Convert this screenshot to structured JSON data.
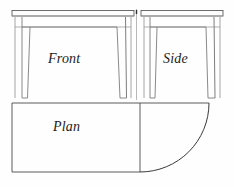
{
  "drawing": {
    "title": "Half-round (demilune) table — orthographic projection",
    "background_color": "#fefefe",
    "line_color": "#3a3a3a",
    "line_color_light": "#8a8a8a",
    "label_color": "#1c1c1c",
    "views": [
      {
        "id": "front",
        "label": "Front",
        "label_x": 48,
        "label_y": 52,
        "font_size": 14,
        "font_style": "italic"
      },
      {
        "id": "side",
        "label": "Side",
        "label_x": 163,
        "label_y": 52,
        "font_size": 14,
        "font_style": "italic"
      },
      {
        "id": "plan",
        "label": "Plan",
        "label_x": 53,
        "label_y": 120,
        "font_size": 14,
        "font_style": "italic"
      }
    ],
    "geometry": {
      "sheet_width": 234,
      "sheet_height": 187,
      "front_view": {
        "top_band": {
          "x": 12,
          "y": 10,
          "width": 122,
          "height": 6
        },
        "body_left": 15,
        "body_right": 131,
        "apron_top": 17,
        "apron_rail_y": 27,
        "legs_bottom": 98,
        "left_leg_top_x": 22,
        "left_leg_bottom_x": 25,
        "left_leg_width_top": 8,
        "left_leg_width_bottom": 6,
        "right_leg_top_x": 117,
        "right_leg_bottom_x": 113,
        "right_leg_width_top": 8,
        "right_leg_width_bottom": 6
      },
      "side_view": {
        "top_band": {
          "x": 141,
          "y": 10,
          "width": 82,
          "height": 6
        },
        "body_left": 144,
        "body_right": 220,
        "apron_top": 17,
        "apron_rail_y": 27,
        "legs_bottom": 98,
        "left_leg_top_x": 150,
        "left_leg_bottom_x": 153,
        "right_leg_top_x": 206,
        "right_leg_bottom_x": 202
      },
      "plan_view": {
        "rect_left": 12,
        "rect_top": 103,
        "rect_right": 140,
        "rect_bottom": 172,
        "centerline_x": 140,
        "arc_radius": 69,
        "arc_start": {
          "x": 209,
          "y": 103
        },
        "arc_end": {
          "x": 140,
          "y": 172
        }
      },
      "centerline": {
        "x": 137,
        "y_top": 2,
        "y_bottom": 180
      }
    }
  }
}
